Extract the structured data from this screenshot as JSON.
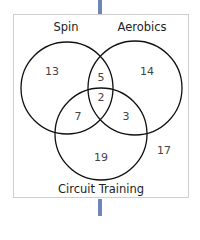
{
  "diagram": {
    "type": "venn-3",
    "sets": [
      {
        "name": "Spin",
        "label": "Spin"
      },
      {
        "name": "Aerobics",
        "label": "Aerobics"
      },
      {
        "name": "Circuit Training",
        "label": "Circuit Training"
      }
    ],
    "regions": {
      "spin_only": "13",
      "aerobics_only": "14",
      "circuit_only": "19",
      "spin_aerobics": "5",
      "spin_circuit": "7",
      "aerobics_circuit": "3",
      "all_three": "2",
      "outside": "17"
    },
    "colors": {
      "connector": "#6f87b8",
      "border": "#cfcfcf",
      "circle_stroke": "#111111"
    }
  }
}
